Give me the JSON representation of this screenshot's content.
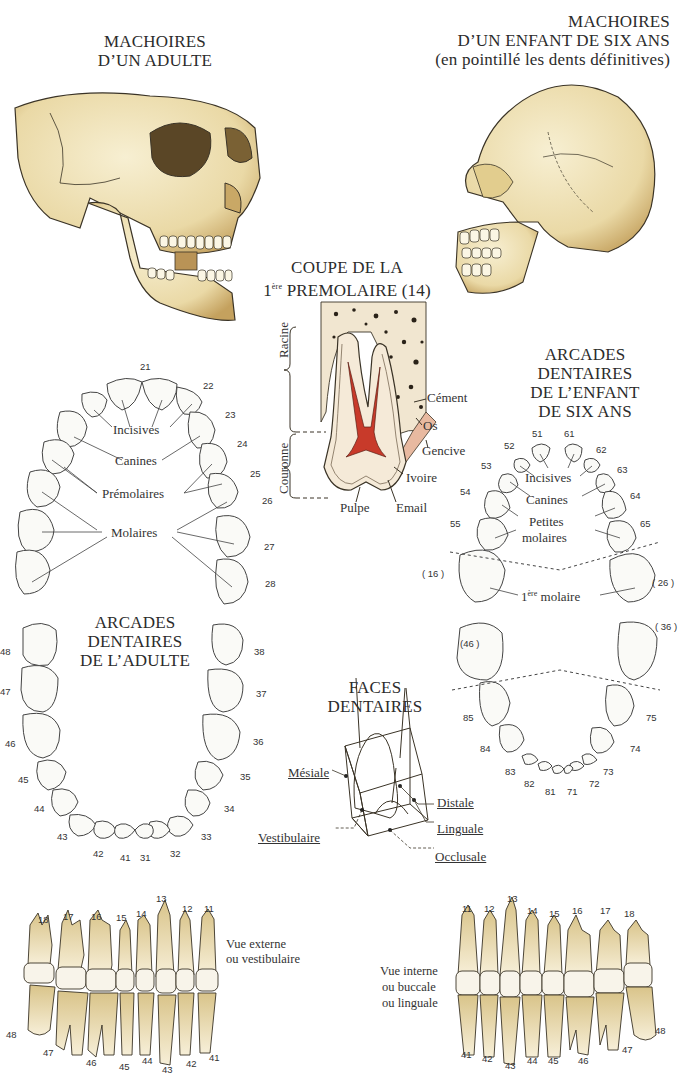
{
  "adult_jaw": {
    "title_line1": "MACHOIRES",
    "title_line2": "D’UN ADULTE"
  },
  "child_jaw": {
    "title_line1": "MACHOIRES",
    "title_line2": "D’UN ENFANT DE SIX ANS",
    "title_line3": "(en pointillé les dents définitives)"
  },
  "premolar_section": {
    "title_line1": "COUPE DE LA",
    "title_line2_sup": "ère",
    "title_line2_prefix": "1",
    "title_line2_rest": " PREMOLAIRE (14)",
    "bracket_labels": {
      "root": "Racine",
      "crown": "Couronne"
    },
    "labels": {
      "cement": "Cément",
      "bone": "Os",
      "gum": "Gencive",
      "dentin": "Ivoire",
      "pulp": "Pulpe",
      "enamel": "Email"
    },
    "pulp_color": "#c83a2a"
  },
  "adult_upper_arch": {
    "numbers": [
      "21",
      "22",
      "23",
      "24",
      "25",
      "26",
      "27",
      "28"
    ],
    "labels": {
      "incisors": "Incisives",
      "canines": "Canines",
      "premolars": "Prémolaires",
      "molars": "Molaires"
    }
  },
  "adult_lower_arch": {
    "title_line1": "ARCADES",
    "title_line2": "DENTAIRES",
    "title_line3": "DE L’ADULTE",
    "left_numbers": [
      "48",
      "47",
      "46",
      "45",
      "44",
      "43",
      "42",
      "41"
    ],
    "right_numbers": [
      "38",
      "37",
      "36",
      "35",
      "34",
      "33",
      "32",
      "31"
    ]
  },
  "child_arches": {
    "title_line1": "ARCADES",
    "title_line2": "DENTAIRES",
    "title_line3": "DE L’ENFANT",
    "title_line4": "DE SIX ANS",
    "upper_numbers": [
      "51",
      "61",
      "52",
      "62",
      "53",
      "63",
      "54",
      "64",
      "55",
      "65"
    ],
    "permanent_upper": [
      "( 16 )",
      "( 26 )"
    ],
    "permanent_lower": [
      "(46 )",
      "( 36 )"
    ],
    "lower_numbers": [
      "85",
      "75",
      "84",
      "74",
      "83",
      "73",
      "82",
      "72",
      "81",
      "71"
    ],
    "labels": {
      "incisors": "Incisives",
      "canines": "Canines",
      "small_molars_1": "Petites",
      "small_molars_2": "molaires",
      "first_molar_prefix": "1",
      "first_molar_sup": "ère",
      "first_molar_rest": " molaire"
    }
  },
  "tooth_faces": {
    "title_line1": "FACES",
    "title_line2": "DENTAIRES",
    "labels": {
      "mesial": "Mésiale",
      "distal": "Distale",
      "lingual": "Linguale",
      "vestibular": "Vestibulaire",
      "occlusal": "Occlusale"
    }
  },
  "external_view": {
    "caption_line1": "Vue externe",
    "caption_line2": "ou vestibulaire",
    "upper_numbers": [
      "18",
      "17",
      "16",
      "15",
      "14",
      "13",
      "12",
      "11"
    ],
    "lower_numbers": [
      "48",
      "47",
      "46",
      "45",
      "44",
      "43",
      "42",
      "41"
    ]
  },
  "internal_view": {
    "caption_line1": "Vue interne",
    "caption_line2": "ou buccale",
    "caption_line3": "ou linguale",
    "upper_numbers": [
      "11",
      "12",
      "13",
      "14",
      "15",
      "16",
      "17",
      "18"
    ],
    "lower_numbers": [
      "41",
      "42",
      "43",
      "44",
      "45",
      "46",
      "47",
      "48"
    ]
  },
  "colors": {
    "bone": "#efe2b4",
    "bone_shade": "#c9a866",
    "outline": "#3a3326",
    "tooth_root": "#e6d5a2",
    "gum_pink": "#e8b9a0"
  }
}
